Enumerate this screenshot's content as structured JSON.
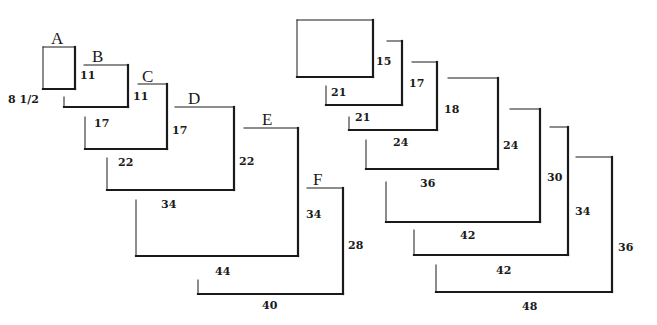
{
  "colors": {
    "line": "#1a1a1a",
    "background": "#ffffff"
  },
  "left_series": {
    "name": "Architectural / ANSI lettered sizes",
    "sheets": [
      {
        "id": "A",
        "label": "A",
        "width_label": "8 1/2",
        "height_label": "11",
        "top": 47,
        "left": 43,
        "right": 75,
        "bottom": 89,
        "closed": true,
        "label_pos": [
          51,
          30
        ],
        "w_pos": [
          8,
          94
        ],
        "h_pos": [
          80,
          70
        ]
      },
      {
        "id": "B",
        "label": "B",
        "width_label": "17",
        "height_label": "11",
        "top": 65,
        "left": 64,
        "right": 128,
        "bottom": 107,
        "top_start": 84,
        "left_tick_top": 97,
        "label_pos": [
          92,
          48
        ],
        "w_pos": [
          94,
          118
        ],
        "h_pos": [
          133,
          91
        ]
      },
      {
        "id": "C",
        "label": "C",
        "width_label": "22",
        "height_label": "17",
        "top": 84,
        "left": 85,
        "right": 167,
        "bottom": 149,
        "top_start": 138,
        "left_tick_top": 117,
        "label_pos": [
          142,
          68
        ],
        "w_pos": [
          118,
          157
        ],
        "h_pos": [
          172,
          125
        ]
      },
      {
        "id": "D",
        "label": "D",
        "width_label": "34",
        "height_label": "22",
        "top": 107,
        "left": 107,
        "right": 234,
        "bottom": 190,
        "top_start": 175,
        "left_tick_top": 158,
        "label_pos": [
          188,
          90
        ],
        "w_pos": [
          161,
          199
        ],
        "h_pos": [
          239,
          156
        ]
      },
      {
        "id": "E",
        "label": "E",
        "width_label": "44",
        "height_label": "34",
        "top": 128,
        "left": 136,
        "right": 298,
        "bottom": 256,
        "top_start": 244,
        "left_tick_top": 200,
        "label_pos": [
          262,
          111
        ],
        "w_pos": [
          215,
          266
        ],
        "h_pos": [
          306,
          209
        ]
      },
      {
        "id": "F",
        "label": "F",
        "width_label": "40",
        "height_label": "28",
        "top": 188,
        "left": 198,
        "right": 343,
        "bottom": 294,
        "top_start": 307,
        "left_tick_top": 280,
        "label_pos": [
          313,
          171
        ],
        "w_pos": [
          262,
          300
        ],
        "h_pos": [
          348,
          240
        ]
      }
    ]
  },
  "right_series": {
    "name": "Standard architectural sizes",
    "sheets": [
      {
        "id": "R1",
        "width_label": "21",
        "height_label": "15",
        "top": 20,
        "left": 297,
        "right": 373,
        "bottom": 77,
        "closed": true,
        "w_pos": [
          331,
          87
        ],
        "h_pos": [
          376,
          56
        ]
      },
      {
        "id": "R2",
        "width_label": "21",
        "height_label": "17",
        "top": 41,
        "left": 326,
        "right": 402,
        "bottom": 105,
        "top_start": 387,
        "left_tick_top": 86,
        "w_pos": [
          355,
          112
        ],
        "h_pos": [
          409,
          78
        ]
      },
      {
        "id": "R3",
        "width_label": "24",
        "height_label": "18",
        "top": 62,
        "left": 349,
        "right": 437,
        "bottom": 130,
        "top_start": 412,
        "left_tick_top": 117,
        "w_pos": [
          393,
          137
        ],
        "h_pos": [
          444,
          104
        ]
      },
      {
        "id": "R4",
        "width_label": "36",
        "height_label": "24",
        "top": 78,
        "left": 366,
        "right": 498,
        "bottom": 169,
        "top_start": 448,
        "left_tick_top": 140,
        "w_pos": [
          420,
          178
        ],
        "h_pos": [
          503,
          140
        ]
      },
      {
        "id": "R5",
        "width_label": "42",
        "height_label": "30",
        "top": 109,
        "left": 386,
        "right": 540,
        "bottom": 222,
        "top_start": 510,
        "left_tick_top": 182,
        "w_pos": [
          460,
          230
        ],
        "h_pos": [
          547,
          172
        ]
      },
      {
        "id": "R6",
        "width_label": "42",
        "height_label": "34",
        "top": 127,
        "left": 414,
        "right": 568,
        "bottom": 255,
        "top_start": 550,
        "left_tick_top": 230,
        "w_pos": [
          496,
          265
        ],
        "h_pos": [
          575,
          206
        ]
      },
      {
        "id": "R7",
        "width_label": "48",
        "height_label": "36",
        "top": 157,
        "left": 436,
        "right": 612,
        "bottom": 292,
        "top_start": 576,
        "left_tick_top": 265,
        "w_pos": [
          522,
          301
        ],
        "h_pos": [
          618,
          242
        ]
      }
    ]
  }
}
